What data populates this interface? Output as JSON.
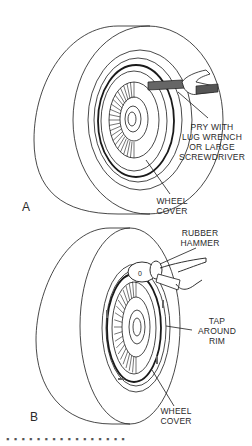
{
  "figure": {
    "panels": [
      {
        "id": "A",
        "letter": "A",
        "labels": {
          "tool": [
            "PRY WITH",
            "LUG WRENCH",
            "OR LARGE",
            "SCREWDRIVER"
          ],
          "part": [
            "WHEEL",
            "COVER"
          ]
        }
      },
      {
        "id": "B",
        "letter": "B",
        "labels": {
          "tool": [
            "RUBBER",
            "HAMMER"
          ],
          "action": [
            "TAP",
            "AROUND",
            "RIM"
          ],
          "part": [
            "WHEEL",
            "COVER"
          ]
        }
      }
    ],
    "caption_partial": "▪ ▪ ▪ ▪ ▪ ▪ ▪ ▪ ▪ ▪ ▪ ▪ ▪ ▪ ▪ ▪"
  },
  "colors": {
    "line": "#1a1a1a",
    "background": "#ffffff",
    "tool_fill": "#555555"
  }
}
